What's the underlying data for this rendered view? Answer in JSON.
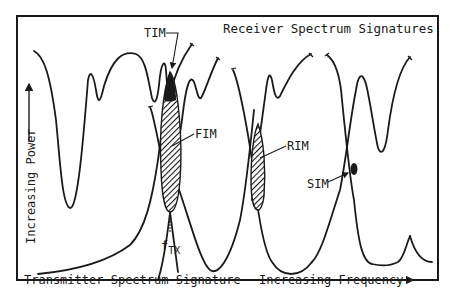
{
  "diagram": {
    "title": "Receiver Spectrum Signatures",
    "transmitter_label": "Transmitter Spectrum Signature",
    "x_axis_label": "Increasing Frequency",
    "y_axis_label": "Increasing Power",
    "colors": {
      "line": "#1a1a1a",
      "background": "#ffffff"
    },
    "annotations": {
      "tim": "TIM",
      "fim": "FIM",
      "rim": "RIM",
      "sim": "SIM",
      "ftx_base": "f",
      "ftx_sub": "TX"
    }
  }
}
